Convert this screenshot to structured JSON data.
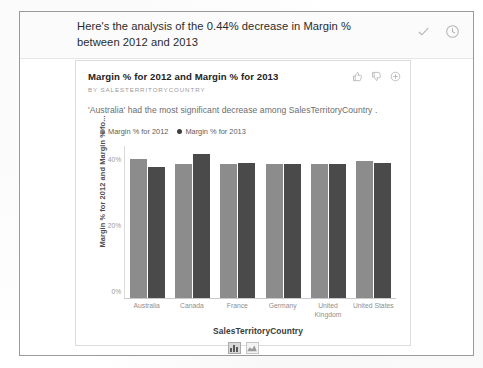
{
  "banner": {
    "text": "Here's the analysis of the 0.44% decrease in Margin % between 2012 and 2013",
    "accept_icon": "check-icon",
    "history_icon": "clock-icon"
  },
  "card": {
    "title": "Margin % for 2012 and Margin % for 2013",
    "subtitle": "BY SALESTERRITORYCOUNTRY",
    "description": "'Australia' had the most significant decrease among SalesTerritoryCountry .",
    "actions": [
      {
        "name": "thumbs-up-icon",
        "label": "Like"
      },
      {
        "name": "thumbs-down-icon",
        "label": "Dislike"
      },
      {
        "name": "plus-circle-icon",
        "label": "Add"
      }
    ],
    "chart_toggles": [
      {
        "name": "bar-chart-toggle",
        "label": "Bar chart",
        "selected": true
      },
      {
        "name": "area-chart-toggle",
        "label": "Area chart",
        "selected": false
      }
    ]
  },
  "chart_data": {
    "type": "bar",
    "title": "Margin % for 2012 and Margin % for 2013",
    "subtitle": "BY SALESTERRITORYCOUNTRY",
    "categories": [
      "Australia",
      "Canada",
      "France",
      "Germany",
      "United Kingdom",
      "United States"
    ],
    "series": [
      {
        "name": "Margin % for 2012",
        "color": "#8c8c8c",
        "values": [
          42.0,
          40.5,
          40.5,
          40.5,
          40.5,
          41.5
        ]
      },
      {
        "name": "Margin % for 2013",
        "color": "#4a4a4a",
        "values": [
          39.5,
          43.5,
          41.0,
          40.5,
          40.5,
          41.0
        ]
      }
    ],
    "xlabel": "SalesTerritoryCountry",
    "ylabel": "Margin % for 2012 and Margin % fo...",
    "yticks": [
      "0%",
      "20%",
      "40%"
    ],
    "ytick_values": [
      0,
      20,
      40
    ],
    "ylim": [
      0,
      46
    ],
    "grid": false,
    "legend": "top-left"
  }
}
